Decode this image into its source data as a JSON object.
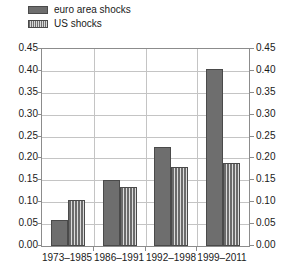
{
  "chart_data": {
    "type": "bar",
    "title": "",
    "xlabel": "",
    "ylabel": "",
    "categories": [
      "1973–1985",
      "1986–1991",
      "1992–1998",
      "1999–2011"
    ],
    "series": [
      {
        "name": "euro area shocks",
        "values": [
          0.06,
          0.15,
          0.225,
          0.405
        ],
        "fill": "solid",
        "color": "#6e6e6e"
      },
      {
        "name": "US shocks",
        "values": [
          0.105,
          0.135,
          0.18,
          0.19
        ],
        "fill": "vertical-stripes",
        "color": "#6e6e6e"
      }
    ],
    "ylim": [
      0.0,
      0.45
    ],
    "ytick_values": [
      0.0,
      0.05,
      0.1,
      0.15,
      0.2,
      0.25,
      0.3,
      0.35,
      0.4,
      0.45
    ],
    "ytick_labels_left": [
      "0.00",
      "0.05",
      "0.10",
      "0.15",
      "0.20",
      "0.25",
      "0.30",
      "0.35",
      "0.40",
      "0.45"
    ],
    "ytick_labels_right": [
      "0.00",
      "0.05",
      "0.10",
      "0.15",
      "0.20",
      "0.25",
      "0.30",
      "0.35",
      "0.40",
      "0.45"
    ],
    "grid": "horizontal-and-vertical",
    "legend_position": "top-left",
    "dual_axis": true
  },
  "legend": {
    "items": [
      {
        "label": "euro area shocks",
        "swatch": "solid-gray-swatch"
      },
      {
        "label": "US shocks",
        "swatch": "striped-gray-swatch"
      }
    ]
  }
}
